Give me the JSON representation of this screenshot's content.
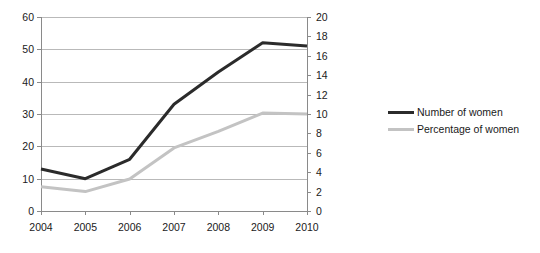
{
  "chart_data": {
    "type": "line",
    "title": "",
    "xlabel": "",
    "ylabel": "",
    "grid": true,
    "legend_position": "right",
    "x": [
      "2004",
      "2005",
      "2006",
      "2007",
      "2008",
      "2009",
      "2010"
    ],
    "categories": [
      "2004",
      "2005",
      "2006",
      "2007",
      "2008",
      "2009",
      "2010"
    ],
    "axes": {
      "left": {
        "label": "",
        "ylim": [
          0,
          60
        ],
        "ticks": [
          0,
          10,
          20,
          30,
          40,
          50,
          60
        ],
        "tick_labels": [
          "0",
          "10",
          "20",
          "30",
          "40",
          "50",
          "60"
        ]
      },
      "right": {
        "label": "",
        "ylim": [
          0,
          20
        ],
        "ticks": [
          0,
          2,
          4,
          6,
          8,
          10,
          12,
          14,
          16,
          18,
          20
        ],
        "tick_labels": [
          "0",
          "2",
          "4",
          "6",
          "8",
          "10",
          "12",
          "14",
          "16",
          "18",
          "20"
        ]
      }
    },
    "series": [
      {
        "name": "Number of women",
        "axis": "left",
        "color": "#2b2b2b",
        "values": [
          13,
          10,
          16,
          33,
          43,
          52,
          51
        ]
      },
      {
        "name": "Percentage of women",
        "axis": "right",
        "color": "#c3c3c3",
        "values": [
          2.5,
          2.0,
          3.3,
          6.5,
          8.2,
          10.1,
          10.0
        ]
      }
    ]
  },
  "legend": {
    "items": [
      {
        "label": "Number of women",
        "color": "#2b2b2b"
      },
      {
        "label": "Percentage of women",
        "color": "#c3c3c3"
      }
    ]
  },
  "colors": {
    "series_dark": "#2b2b2b",
    "series_light": "#c3c3c3",
    "gridline": "#b9b9b9",
    "axis": "#8a8a8a",
    "text": "#1a1a1a",
    "background": "#ffffff"
  }
}
